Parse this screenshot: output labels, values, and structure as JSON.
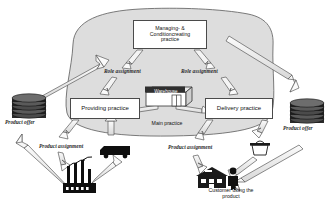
{
  "diagram": {
    "background_color": "#ffffff",
    "blob_fill": "#dddddd",
    "blob_stroke": "#555555",
    "arrow_fill": "#f2f2f2",
    "arrow_stroke": "#4a4a4a",
    "boxes": [
      {
        "id": "managing",
        "label": "Managing- &\nConditioncreating\npractice"
      },
      {
        "id": "providing",
        "label": "Providing practice"
      },
      {
        "id": "delivery",
        "label": "Delivery practice"
      }
    ],
    "labels": {
      "managing": "Managing- & Conditioncreating practice",
      "managing_line1": "Managing- &",
      "managing_line2": "Conditioncreating",
      "managing_line3": "practice",
      "providing": "Providing practice",
      "delivery": "Delivery practice",
      "main_practice": "Main practice",
      "warehouse": "Warehouse",
      "role_assignment_left": "Role assignment",
      "role_assignment_right": "Role assignment",
      "product_assignment_left": "Product assignment",
      "product_assignment_right": "Product assignment",
      "product_offer_left": "Product offer",
      "product_offer_right": "Product offer",
      "customer_line1": "Customer using the",
      "customer_line2": "product",
      "customer": "Customer using the product"
    },
    "icons": [
      {
        "id": "product-offer-stack-left",
        "name": "stack-of-discs-icon",
        "label": "Product offer"
      },
      {
        "id": "product-offer-stack-right",
        "name": "stack-of-discs-icon",
        "label": "Product offer"
      },
      {
        "id": "warehouse",
        "name": "warehouse-building-icon",
        "label": "Warehouse"
      },
      {
        "id": "factory",
        "name": "factory-icon",
        "label": ""
      },
      {
        "id": "truck",
        "name": "truck-icon",
        "label": ""
      },
      {
        "id": "basket",
        "name": "basket-icon",
        "label": ""
      },
      {
        "id": "house",
        "name": "house-icon",
        "label": ""
      },
      {
        "id": "person",
        "name": "person-icon",
        "label": ""
      }
    ],
    "connections": [
      {
        "from": "managing",
        "to": "providing",
        "label": "Role assignment"
      },
      {
        "from": "managing",
        "to": "delivery",
        "label": "Role assignment"
      },
      {
        "from": "providing",
        "to": "factory",
        "label": "Product assignment"
      },
      {
        "from": "delivery",
        "to": "customer",
        "label": "Product assignment"
      },
      {
        "from": "product-offer-left",
        "to": "main-practice",
        "label": ""
      },
      {
        "from": "main-practice",
        "to": "product-offer-right",
        "label": ""
      },
      {
        "from": "product-offer-right",
        "to": "customer",
        "label": ""
      },
      {
        "from": "factory",
        "to": "product-offer-left",
        "label": ""
      },
      {
        "from": "warehouse",
        "to": "providing",
        "label": ""
      },
      {
        "from": "warehouse",
        "to": "delivery",
        "label": ""
      },
      {
        "from": "factory",
        "to": "truck",
        "label": ""
      },
      {
        "from": "basket",
        "to": "customer",
        "label": ""
      }
    ]
  }
}
